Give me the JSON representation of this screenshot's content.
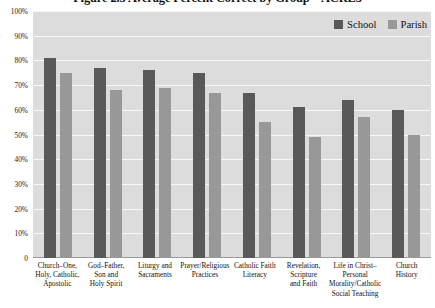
{
  "chart_data": {
    "type": "bar",
    "title": "Figure 2.3 Average Percent Correct by Group – ACRE3",
    "xlabel": "",
    "ylabel": "",
    "ylim": [
      0,
      100
    ],
    "grid": true,
    "legend_position": "top-right",
    "categories": [
      "Church–One, Holy, Catholic, Apostolic",
      "God–Father, Son and Holy Spirit",
      "Liturgy and Sacraments",
      "Prayer/Religious Practices",
      "Catholic Faith Literacy",
      "Revelation, Scripture and Faith",
      "Life in Christ–Personal Morality/Catholic Social Teaching",
      "Church History"
    ],
    "category_lines": [
      [
        "Church–One,",
        "Holy, Catholic,",
        "Apostolic"
      ],
      [
        "God–Father,",
        "Son and",
        "Holy Spirit"
      ],
      [
        "Liturgy and",
        "Sacraments"
      ],
      [
        "Prayer/Religious",
        "Practices"
      ],
      [
        "Catholic Faith",
        "Literacy"
      ],
      [
        "Revelation,",
        "Scripture",
        "and Faith"
      ],
      [
        "Life in Christ–",
        "Personal",
        "Morality/Catholic",
        "Social Teaching"
      ],
      [
        "Church",
        "History"
      ]
    ],
    "series": [
      {
        "name": "School",
        "color": "#595959",
        "values": [
          81,
          77,
          76,
          75,
          67,
          61,
          64,
          60
        ]
      },
      {
        "name": "Parish",
        "color": "#989898",
        "values": [
          75,
          68,
          69,
          67,
          55,
          49,
          57,
          50
        ]
      }
    ],
    "y_ticks": [
      {
        "value": 100,
        "label": "100%"
      },
      {
        "value": 90,
        "label": "90%"
      },
      {
        "value": 80,
        "label": "80%"
      },
      {
        "value": 70,
        "label": "70%"
      },
      {
        "value": 60,
        "label": "60%"
      },
      {
        "value": 50,
        "label": "50%"
      },
      {
        "value": 40,
        "label": "40%"
      },
      {
        "value": 30,
        "label": "30%"
      },
      {
        "value": 20,
        "label": "20%"
      },
      {
        "value": 10,
        "label": "10%"
      },
      {
        "value": 0,
        "label": "0"
      }
    ]
  }
}
